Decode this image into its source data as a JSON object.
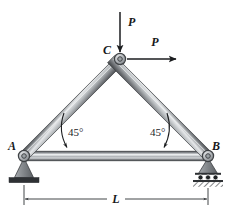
{
  "figure": {
    "type": "engineering-truss-diagram",
    "background_color": "#ffffff",
    "width": 231,
    "height": 217
  },
  "joints": [
    {
      "id": "A",
      "label": "A",
      "x": 24,
      "y": 156,
      "support": "pin",
      "label_x": 12,
      "label_y": 150
    },
    {
      "id": "B",
      "label": "B",
      "x": 208,
      "y": 156,
      "support": "roller",
      "label_x": 214,
      "label_y": 150
    },
    {
      "id": "C",
      "label": "C",
      "x": 120,
      "y": 59,
      "support": "none",
      "label_x": 107,
      "label_y": 54
    }
  ],
  "members": [
    {
      "id": "AC",
      "from": "A",
      "to": "C",
      "style": "cylindrical-bar"
    },
    {
      "id": "CB",
      "from": "C",
      "to": "B",
      "style": "cylindrical-bar"
    },
    {
      "id": "AB",
      "from": "A",
      "to": "B",
      "style": "cylindrical-bar"
    }
  ],
  "loads": [
    {
      "id": "vertical-load",
      "label": "P",
      "direction": "down",
      "applied_at": "C",
      "tail_x": 120,
      "tail_y": 12,
      "head_x": 120,
      "head_y": 53,
      "label_x": 126,
      "label_y": 24
    },
    {
      "id": "horizontal-load",
      "label": "P",
      "direction": "right",
      "applied_at": "C",
      "tail_x": 127,
      "tail_y": 59,
      "head_x": 177,
      "head_y": 59,
      "label_x": 155,
      "label_y": 45
    }
  ],
  "angles": [
    {
      "id": "angle-at-A",
      "label": "45°",
      "at": "A",
      "label_x": 67,
      "label_y": 136
    },
    {
      "id": "angle-at-B",
      "label": "45°",
      "at": "B",
      "label_x": 151,
      "label_y": 136
    }
  ],
  "dimensions": [
    {
      "id": "span-L",
      "label": "L",
      "from": "A",
      "to": "B",
      "x1": 24,
      "x2": 208,
      "y": 199,
      "label_x": 116,
      "label_y": 199
    }
  ],
  "supports": {
    "pin": {
      "at": "A",
      "description": "pinned support, triangle on solid ground base"
    },
    "roller": {
      "at": "B",
      "description": "roller support, triangle on rollers over hatched ground base"
    }
  },
  "colors": {
    "member_dark": "#4d5053",
    "member_mid": "#8e9296",
    "member_light": "#e3e5e7",
    "joint_fill": "#b8bcc0",
    "joint_stroke": "#46494c",
    "support_fill": "#8b8f93",
    "support_stroke": "#3c3f42",
    "ground_dark": "#2e3134",
    "ink": "#16181a",
    "dimension_line": "#2e3134"
  },
  "corner_marks": {
    "top_right_faint": ""
  }
}
